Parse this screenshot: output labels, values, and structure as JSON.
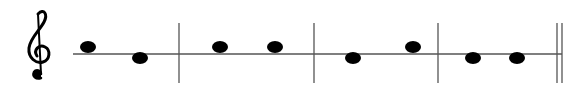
{
  "score": {
    "clef": "treble-clef-icon",
    "staff": {
      "y": 54,
      "x_start": 73,
      "x_end": 562,
      "color": "#555555"
    },
    "barlines": [
      {
        "x": 179,
        "type": "single"
      },
      {
        "x": 314,
        "type": "single"
      },
      {
        "x": 438,
        "type": "single"
      },
      {
        "x": 557,
        "type": "final-double",
        "x2": 562
      }
    ],
    "measures": [
      {
        "notes": [
          {
            "position": "above",
            "x": 88
          },
          {
            "position": "below",
            "x": 140
          }
        ]
      },
      {
        "notes": [
          {
            "position": "above",
            "x": 220
          },
          {
            "position": "above",
            "x": 275
          }
        ]
      },
      {
        "notes": [
          {
            "position": "below",
            "x": 353
          },
          {
            "position": "above",
            "x": 413
          }
        ]
      },
      {
        "notes": [
          {
            "position": "below",
            "x": 473
          },
          {
            "position": "below",
            "x": 517
          }
        ]
      }
    ],
    "note_color": "#000000"
  }
}
